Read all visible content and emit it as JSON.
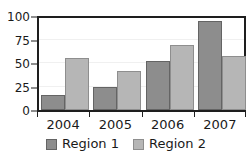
{
  "chart_data": {
    "type": "bar",
    "title": "",
    "xlabel": "",
    "ylabel": "",
    "categories": [
      "2004",
      "2005",
      "2006",
      "2007"
    ],
    "series": [
      {
        "name": "Region 1",
        "color": "#8d8d8d",
        "values": [
          16,
          25,
          52,
          95
        ]
      },
      {
        "name": "Region 2",
        "color": "#b6b6b6",
        "values": [
          55,
          42,
          69,
          57
        ]
      }
    ],
    "ylim": [
      0,
      100
    ],
    "yticks": [
      0,
      25,
      50,
      75,
      100
    ],
    "ytick_labels": [
      "0",
      "25",
      "50",
      "75",
      "100"
    ],
    "grid": true,
    "legend_position": "bottom"
  },
  "axes": {
    "y_labels": [
      "100",
      "75",
      "50",
      "25",
      "0"
    ],
    "x_labels": [
      "2004",
      "2005",
      "2006",
      "2007"
    ]
  },
  "legend": {
    "items": [
      {
        "label": "Region 1",
        "color": "#8d8d8d"
      },
      {
        "label": "Region 2",
        "color": "#b6b6b6"
      }
    ]
  },
  "cropped_title": ""
}
